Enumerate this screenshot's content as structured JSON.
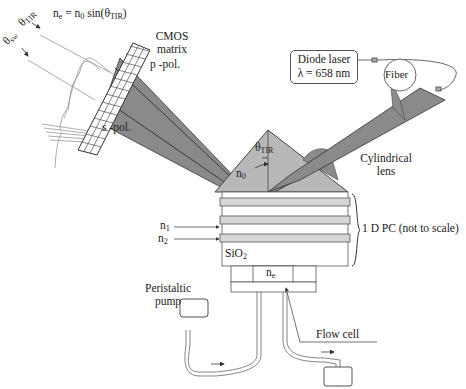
{
  "diagram": {
    "formula": {
      "lhs": "n",
      "lhs_sub": "e",
      "eq": " = n",
      "n0_sub": "0",
      "rest": " sin(θ",
      "theta_sub": "TIR",
      "close": ")"
    },
    "angles": {
      "theta_sw": "θ",
      "theta_sw_sub": "sw",
      "theta_tir": "θ",
      "theta_tir_sub": "TIR"
    },
    "cmos": {
      "line1": "CMOS",
      "line2": "matrix"
    },
    "polarizations": {
      "p": "p -pol.",
      "s": "s -pol."
    },
    "laser": {
      "line1": "Diode laser",
      "line2": "λ = 658 nm"
    },
    "fiber": "Fiber",
    "prism": {
      "n0": "n",
      "n0_sub": "0",
      "theta": "θ",
      "theta_sub": "TIR"
    },
    "lens": {
      "line1": "Cylindrical",
      "line2": "lens"
    },
    "stack": {
      "label": "1 D PC (not to scale)",
      "n1": "n",
      "n1_sub": "1",
      "n2": "n",
      "n2_sub": "2",
      "substrate": "SiO",
      "substrate_sub": "2"
    },
    "flow_cell": {
      "ne": "n",
      "ne_sub": "e",
      "label": "Flow cell"
    },
    "pump": {
      "line1": "Peristaltic",
      "line2": "pump"
    },
    "colors": {
      "beam": "#8a8a8a",
      "prism": "#b8b8b8",
      "layer": "#d6d6d6",
      "stroke": "#444444"
    }
  }
}
